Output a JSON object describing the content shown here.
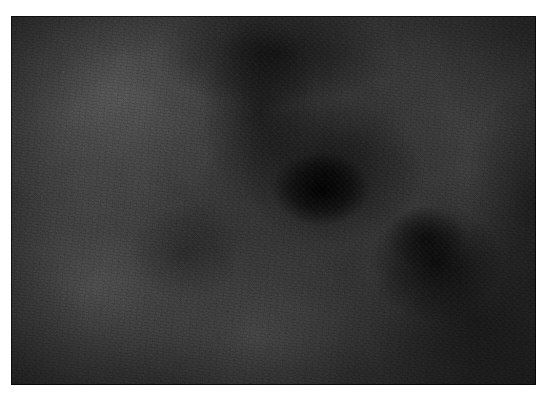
{
  "page": {
    "width": 548,
    "height": 400,
    "background_color": "#ffffff",
    "alt_text": ""
  },
  "photograph": {
    "name": "dark-textile-texture",
    "subject": "close-up of dark grey-black felted textile surface",
    "left": 11,
    "top": 16,
    "width": 525,
    "height": 369,
    "caption": "",
    "palette": {
      "base": "#2c2c2c",
      "highlight": "#585858",
      "midtone": "#3a3a3a",
      "shadow": "#141414",
      "deepest_shadow": "#050505",
      "border": "#000000"
    },
    "tonal_regions": [
      {
        "name": "upper-left-highlight",
        "center_x_pct": 20,
        "center_y_pct": 22,
        "tone": "#585858"
      },
      {
        "name": "lower-left-highlight",
        "center_x_pct": 16,
        "center_y_pct": 74,
        "tone": "#505050"
      },
      {
        "name": "bottom-center-midtone",
        "center_x_pct": 46,
        "center_y_pct": 86,
        "tone": "#4a4a4a"
      },
      {
        "name": "upper-center-dark-band",
        "center_x_pct": 50,
        "center_y_pct": 10,
        "tone": "#151515"
      },
      {
        "name": "central-dark-blot",
        "center_x_pct": 59,
        "center_y_pct": 47,
        "tone": "#050505"
      },
      {
        "name": "right-dark-smudge",
        "center_x_pct": 81,
        "center_y_pct": 67,
        "tone": "#0e0e0e"
      },
      {
        "name": "lower-right-shadow",
        "center_x_pct": 88,
        "center_y_pct": 82,
        "tone": "#1a1a1a"
      }
    ],
    "surface": {
      "texture": "fine granular fibrous nap",
      "grain": "dense speckle noise",
      "weave_visible": "no"
    }
  }
}
